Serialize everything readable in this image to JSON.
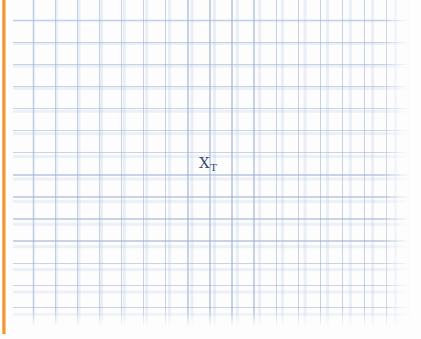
{
  "canvas": {
    "width": 421,
    "height": 339,
    "background_color": "#fdfdfe"
  },
  "accent_bar": {
    "name": "left-accent-bar",
    "color": "#f2972f",
    "orientation": "vertical",
    "position": "left-edge"
  },
  "grid": {
    "name": "graph-paper-grid",
    "line_color": "#96aacd",
    "cell_size_px": 22,
    "style": "square-grid",
    "columns": 18,
    "rows": 15
  },
  "marker": {
    "name": "x-sub-t-marker",
    "symbol": "X",
    "subscript": "T",
    "full_label": "X_T",
    "color": "#3e4a6d",
    "x": 207,
    "y": 167
  },
  "chart_data": {
    "type": "scatter",
    "title": "",
    "subtitle": "",
    "xlabel": "",
    "ylabel": "",
    "grid": true,
    "legend": null,
    "xlim": [
      0,
      18
    ],
    "ylim": [
      0,
      15
    ],
    "tick_labels": {
      "x": [],
      "y": []
    },
    "annotations": [
      {
        "text": "X_T",
        "symbol": "X",
        "subscript": "T",
        "x": 8.8,
        "y": 7.6,
        "color": "#3e4a6d"
      }
    ],
    "series": [
      {
        "name": "X_T",
        "points": [
          {
            "x": 8.8,
            "y": 7.6
          }
        ],
        "marker": "text-label",
        "color": "#3e4a6d"
      }
    ]
  }
}
